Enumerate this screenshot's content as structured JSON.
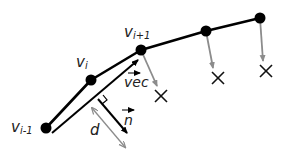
{
  "diagram": {
    "colors": {
      "polyline": "#000000",
      "gray_arrow": "#8c8c8c",
      "marker": "#111111",
      "label": "#222222",
      "background": "#ffffff"
    },
    "vertices": [
      {
        "id": "v_im1",
        "x": 46,
        "y": 128
      },
      {
        "id": "v_i",
        "x": 91,
        "y": 80
      },
      {
        "id": "v_ip1",
        "x": 141,
        "y": 50
      },
      {
        "id": "v_4",
        "x": 206,
        "y": 31
      },
      {
        "id": "v_5",
        "x": 260,
        "y": 18
      }
    ],
    "labels": {
      "v_im1": {
        "base": "v",
        "sub": "i-1"
      },
      "v_i": {
        "base": "v",
        "sub": "i"
      },
      "v_ip1": {
        "base": "v",
        "sub": "i+1"
      },
      "vec": "vec",
      "n": "n",
      "d": "d"
    },
    "projections": [
      {
        "from": "v_ip1",
        "to_x": 158,
        "to_y": 88,
        "marker_x": 161,
        "marker_y": 96
      },
      {
        "from": "v_4",
        "to_x": 214,
        "to_y": 70,
        "marker_x": 218,
        "marker_y": 78
      },
      {
        "from": "v_5",
        "to_x": 263,
        "to_y": 63,
        "marker_x": 266,
        "marker_y": 71
      }
    ],
    "vec_arrow": {
      "x1": 52,
      "y1": 133,
      "x2": 140,
      "y2": 58
    },
    "normal_arrow": {
      "x1": 98,
      "y1": 99,
      "x2": 128,
      "y2": 134
    },
    "distance_arrow": {
      "x1": 92,
      "y1": 108,
      "x2": 125,
      "y2": 147
    },
    "right_angle_marker": {
      "x": 98,
      "y": 99
    }
  }
}
